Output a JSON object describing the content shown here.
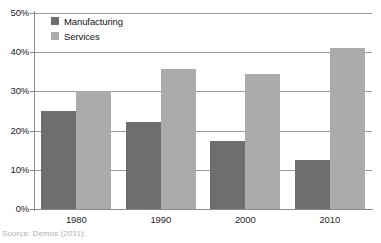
{
  "chart_data": {
    "type": "bar",
    "title": "",
    "subtitle": "",
    "xlabel": "",
    "ylabel": "",
    "categories": [
      "1980",
      "1990",
      "2000",
      "2010"
    ],
    "series": [
      {
        "name": "Manufacturing",
        "color": "#6e6e6e",
        "values": [
          25.0,
          22.2,
          17.3,
          12.5
        ]
      },
      {
        "name": "Services",
        "color": "#ababab",
        "values": [
          30.0,
          35.7,
          34.5,
          41.2
        ]
      }
    ],
    "ylim": [
      0,
      50
    ],
    "yticks": [
      0,
      10,
      20,
      30,
      40,
      50
    ],
    "ytick_labels": [
      "0%",
      "10%",
      "20%",
      "30%",
      "40%",
      "50%"
    ],
    "grid": true,
    "grid_axis": "y",
    "legend_position": "top-left-inside",
    "value_format": "percent",
    "annotations": []
  },
  "legend": {
    "entries": [
      {
        "label": "Manufacturing",
        "swatch": "legend-swatch-manufacturing"
      },
      {
        "label": "Services",
        "swatch": "legend-swatch-services"
      }
    ]
  },
  "caption": {
    "source": "Source: Demos (2011)."
  },
  "colors": {
    "manufacturing": "#6e6e6e",
    "services": "#ababab",
    "axis": "#8a8a8a",
    "gridline": "#9a9a9a",
    "text": "#1a1a1a",
    "caption_text": "#b0b0b0",
    "background": "#ffffff"
  }
}
